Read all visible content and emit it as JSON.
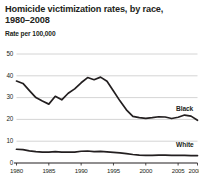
{
  "chart_data": {
    "type": "line",
    "title": "Homicide victimization rates, by race, 1980–2008",
    "title_line1": "Homicide victimization rates, by race,",
    "title_line2": "1980–2008",
    "subtitle": "Rate per 100,000",
    "xlabel": "",
    "ylabel": "Rate per 100,000",
    "ylim": [
      0,
      50
    ],
    "xlim": [
      1980,
      2008
    ],
    "grid": true,
    "grid_axis": "y",
    "legend_position": "inline-right",
    "yticks": [
      0,
      10,
      20,
      30,
      40,
      50
    ],
    "ytick_labels": [
      "0",
      "10",
      "20",
      "30",
      "40",
      "50"
    ],
    "xticks": [
      1980,
      1985,
      1990,
      1995,
      2000,
      2005,
      2008
    ],
    "xtick_labels": [
      "1980",
      "1985",
      "1990",
      "1995",
      "2000",
      "2005",
      "2008"
    ],
    "x": [
      1980,
      1981,
      1982,
      1983,
      1984,
      1985,
      1986,
      1987,
      1988,
      1989,
      1990,
      1991,
      1992,
      1993,
      1994,
      1995,
      1996,
      1997,
      1998,
      1999,
      2000,
      2001,
      2002,
      2003,
      2004,
      2005,
      2006,
      2007,
      2008
    ],
    "series": [
      {
        "name": "Black",
        "color": "#231f20",
        "values": [
          37.6,
          36.5,
          33.2,
          30.0,
          28.4,
          27.0,
          30.6,
          29.0,
          32.0,
          34.0,
          36.8,
          39.2,
          38.2,
          39.4,
          37.5,
          33.0,
          28.5,
          24.4,
          21.4,
          20.8,
          20.5,
          20.8,
          21.2,
          21.1,
          20.4,
          21.0,
          22.0,
          21.5,
          19.6
        ]
      },
      {
        "name": "White",
        "color": "#231f20",
        "values": [
          6.3,
          6.1,
          5.6,
          5.2,
          5.0,
          5.0,
          5.2,
          5.0,
          5.0,
          5.0,
          5.4,
          5.5,
          5.2,
          5.3,
          5.1,
          4.9,
          4.6,
          4.3,
          3.9,
          3.6,
          3.5,
          3.5,
          3.6,
          3.6,
          3.5,
          3.5,
          3.5,
          3.4,
          3.4
        ]
      }
    ],
    "annotations": [
      {
        "text": "Black",
        "x": 2005,
        "y": 24.5
      },
      {
        "text": "White",
        "x": 2005,
        "y": 8.0
      }
    ],
    "colors": {
      "line": "#231f20",
      "grid": "#c9c9c9",
      "axis": "#231f20",
      "text": "#231f20",
      "background": "#ffffff"
    }
  }
}
